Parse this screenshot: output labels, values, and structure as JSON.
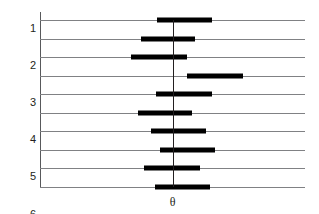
{
  "chart_data": {
    "type": "bar",
    "title": "",
    "subtitle": "",
    "xlabel": "θ",
    "ylabel": "Amostras",
    "orientation": "horizontal",
    "grid": true,
    "legend": null,
    "xlim": [
      0,
      10
    ],
    "ylim": [
      1,
      10
    ],
    "reference_line": {
      "label": "θ",
      "value": 5.0,
      "orientation": "vertical"
    },
    "categories": [
      "1",
      "2",
      "3",
      "4",
      "5",
      "6",
      "7",
      "8",
      "9",
      "10"
    ],
    "series": [
      {
        "name": "Intervalo de confiança",
        "type": "interval",
        "intervals": [
          {
            "sample": "1",
            "lower": 4.41,
            "upper": 6.49,
            "contains_theta": true
          },
          {
            "sample": "2",
            "lower": 3.81,
            "upper": 5.85,
            "contains_theta": true
          },
          {
            "sample": "3",
            "lower": 3.44,
            "upper": 5.55,
            "contains_theta": true
          },
          {
            "sample": "4",
            "lower": 5.55,
            "upper": 7.66,
            "contains_theta": false
          },
          {
            "sample": "5",
            "lower": 4.38,
            "upper": 6.49,
            "contains_theta": true
          },
          {
            "sample": "6",
            "lower": 3.7,
            "upper": 5.74,
            "contains_theta": true
          },
          {
            "sample": "7",
            "lower": 4.19,
            "upper": 6.26,
            "contains_theta": true
          },
          {
            "sample": "8",
            "lower": 4.53,
            "upper": 6.6,
            "contains_theta": true
          },
          {
            "sample": "9",
            "lower": 3.93,
            "upper": 6.04,
            "contains_theta": true
          },
          {
            "sample": "10",
            "lower": 4.34,
            "upper": 6.41,
            "contains_theta": true
          }
        ]
      }
    ],
    "colors": {
      "bar": "#000000",
      "grid": "#808184",
      "axis": "#58595b",
      "text": "#231f20",
      "background": "#ffffff"
    }
  }
}
